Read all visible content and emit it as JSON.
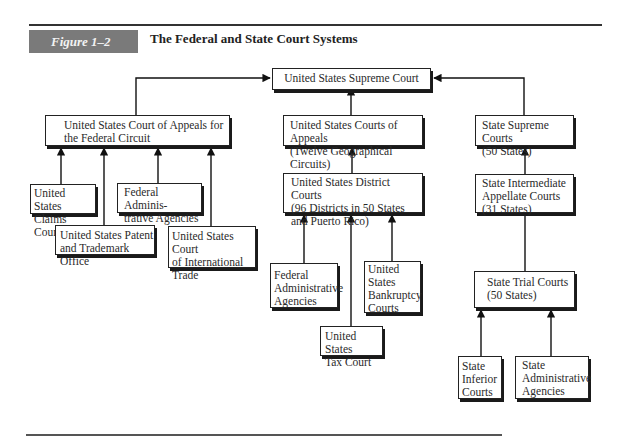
{
  "figure": {
    "label": "Figure 1–2",
    "title": "The Federal and State Court Systems"
  },
  "nodes": {
    "supreme": "United States Supreme Court",
    "fed_circuit": "United States Court of Appeals for\nthe Federal Circuit",
    "appeals": "United States Courts of Appeals\n(Twelve Geographical Circuits)",
    "state_supreme": "State Supreme Courts\n(50 States)",
    "claims": "United States\nClaims Court",
    "patent": "United States Patent\nand Trademark Office",
    "fed_admin_1": "Federal Adminis-\ntrative Agencies",
    "intl_trade": "United States Court\nof International\nTrade",
    "district": "United States District Courts\n(96 Districts in 50 States\nand Puerto Rico)",
    "state_intermediate": "State Intermediate\nAppellate Courts\n(31 States)",
    "fed_admin_2": "Federal\nAdministrative\nAgencies",
    "tax": "United States\nTax Court",
    "bankruptcy": "United\nStates\nBankruptcy\nCourts",
    "state_trial": "State Trial Courts\n(50 States)",
    "state_inferior": "State\nInferior\nCourts",
    "state_admin": "State\nAdministrative\nAgencies"
  },
  "edges": [
    {
      "from": "fed_circuit",
      "to": "supreme"
    },
    {
      "from": "appeals",
      "to": "supreme"
    },
    {
      "from": "state_supreme",
      "to": "supreme"
    },
    {
      "from": "claims",
      "to": "fed_circuit"
    },
    {
      "from": "patent",
      "to": "fed_circuit"
    },
    {
      "from": "fed_admin_1",
      "to": "fed_circuit"
    },
    {
      "from": "intl_trade",
      "to": "fed_circuit"
    },
    {
      "from": "district",
      "to": "appeals"
    },
    {
      "from": "fed_admin_2",
      "to": "district"
    },
    {
      "from": "tax",
      "to": "district"
    },
    {
      "from": "bankruptcy",
      "to": "district"
    },
    {
      "from": "state_intermediate",
      "to": "state_supreme"
    },
    {
      "from": "state_trial",
      "to": "state_intermediate"
    },
    {
      "from": "state_inferior",
      "to": "state_trial"
    },
    {
      "from": "state_admin",
      "to": "state_trial"
    }
  ]
}
